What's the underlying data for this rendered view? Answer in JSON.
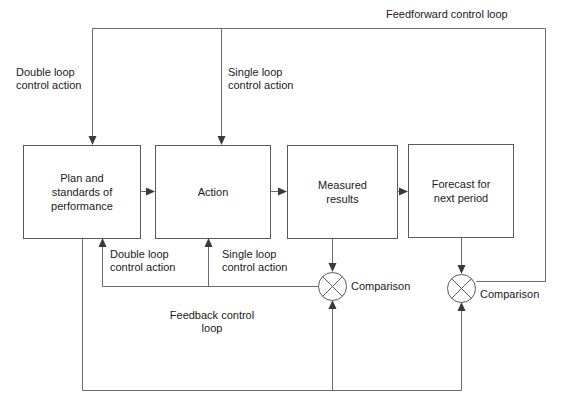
{
  "diagram": {
    "boxes": [
      {
        "id": "plan",
        "label": "Plan and\nstandards of\nperformance",
        "x": 23,
        "y": 145,
        "w": 117,
        "h": 93
      },
      {
        "id": "action",
        "label": "Action",
        "x": 155,
        "y": 145,
        "w": 115,
        "h": 93
      },
      {
        "id": "measured",
        "label": "Measured\nresults",
        "x": 287,
        "y": 145,
        "w": 110,
        "h": 93
      },
      {
        "id": "forecast",
        "label": "Forecast for\nnext period",
        "x": 408,
        "y": 144,
        "w": 105,
        "h": 93
      }
    ],
    "nodes": [
      {
        "id": "comparison-1",
        "label": "Comparison",
        "cx": 332,
        "cy": 286,
        "r": 14
      },
      {
        "id": "comparison-2",
        "label": "Comparison",
        "cx": 461,
        "cy": 288,
        "r": 14
      }
    ],
    "labels": [
      {
        "id": "feedforward-control-loop",
        "text": "Feedforward control loop",
        "x": 386,
        "y": 8,
        "align": "left"
      },
      {
        "id": "double-loop-control-action-top",
        "text": "Double loop\ncontrol action",
        "x": 16,
        "y": 66,
        "align": "left"
      },
      {
        "id": "single-loop-control-action-top",
        "text": "Single loop\ncontrol action",
        "x": 228,
        "y": 66,
        "align": "left"
      },
      {
        "id": "double-loop-control-action-bottom",
        "text": "Double loop\ncontrol action",
        "x": 110,
        "y": 248,
        "align": "left"
      },
      {
        "id": "single-loop-control-action-bottom",
        "text": "Single loop\ncontrol action",
        "x": 222,
        "y": 248,
        "align": "left"
      },
      {
        "id": "feedback-control-loop",
        "text": "Feedback control\nloop",
        "x": 157,
        "y": 309,
        "align": "center"
      }
    ],
    "colors": {
      "background": "#ffffff",
      "box_stroke": "#5b5b5b",
      "connector": "#6b6b6b",
      "text": "#1a1a1a",
      "arrow": "#3a3a3a"
    }
  }
}
